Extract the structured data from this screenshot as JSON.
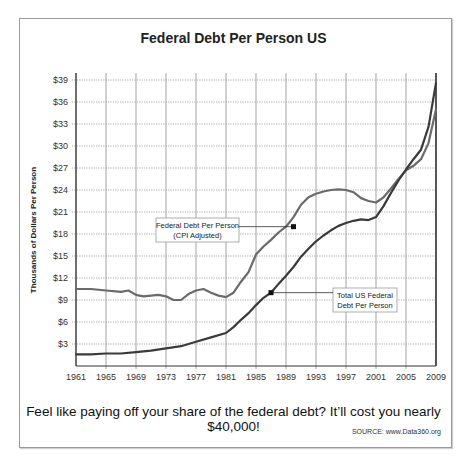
{
  "chart_data": {
    "type": "line",
    "title": "Federal Debt Per Person US",
    "xlabel": "",
    "ylabel": "Thousands of Dollars Per Person",
    "x_ticks": [
      "1961",
      "1965",
      "1969",
      "1973",
      "1977",
      "1981",
      "1985",
      "1989",
      "1993",
      "1997",
      "2001",
      "2005",
      "2009"
    ],
    "y_ticks": [
      "$3",
      "$6",
      "$9",
      "$12",
      "$15",
      "$18",
      "$21",
      "$24",
      "$27",
      "$30",
      "$33",
      "$36",
      "$39"
    ],
    "xlim": [
      1961,
      2009
    ],
    "ylim": [
      0,
      40
    ],
    "grid": true,
    "series": [
      {
        "name": "Federal Debt Per Person (CPI Adjusted)",
        "color": "#6a6a6a",
        "x": [
          1961,
          1963,
          1965,
          1967,
          1968,
          1969,
          1970,
          1972,
          1973,
          1974,
          1975,
          1976,
          1977,
          1978,
          1979,
          1980,
          1981,
          1982,
          1983,
          1984,
          1985,
          1986,
          1987,
          1988,
          1989,
          1990,
          1991,
          1992,
          1993,
          1994,
          1995,
          1996,
          1997,
          1998,
          1999,
          2000,
          2001,
          2002,
          2003,
          2004,
          2005,
          2006,
          2007,
          2008,
          2009
        ],
        "values": [
          10.5,
          10.5,
          10.3,
          10.1,
          10.3,
          9.7,
          9.5,
          9.7,
          9.5,
          9.0,
          9.0,
          9.8,
          10.3,
          10.5,
          10.0,
          9.6,
          9.4,
          10.0,
          11.5,
          12.8,
          15.2,
          16.3,
          17.2,
          18.2,
          19.0,
          20.3,
          22.0,
          23.0,
          23.5,
          23.8,
          24.0,
          24.1,
          24.0,
          23.7,
          22.9,
          22.5,
          22.3,
          23.0,
          24.2,
          25.5,
          26.7,
          27.3,
          28.2,
          30.4,
          35.0
        ]
      },
      {
        "name": "Total US Federal Debt Per Person",
        "color": "#3a3a3a",
        "x": [
          1961,
          1963,
          1965,
          1967,
          1969,
          1971,
          1973,
          1975,
          1977,
          1979,
          1981,
          1982,
          1983,
          1984,
          1985,
          1986,
          1987,
          1988,
          1989,
          1990,
          1991,
          1992,
          1993,
          1994,
          1995,
          1996,
          1997,
          1998,
          1999,
          2000,
          2001,
          2002,
          2003,
          2004,
          2005,
          2006,
          2007,
          2008,
          2009
        ],
        "values": [
          1.6,
          1.6,
          1.7,
          1.7,
          1.9,
          2.1,
          2.4,
          2.7,
          3.3,
          3.9,
          4.5,
          5.3,
          6.3,
          7.2,
          8.3,
          9.3,
          10.0,
          11.2,
          12.3,
          13.5,
          14.9,
          16.0,
          17.0,
          17.8,
          18.5,
          19.1,
          19.5,
          19.8,
          20.0,
          19.9,
          20.3,
          21.8,
          23.6,
          25.3,
          26.8,
          28.2,
          29.5,
          32.6,
          38.6
        ]
      }
    ],
    "annotations": [
      {
        "text_lines": [
          "Federal Debt Per Person",
          "(CPI Adjusted)"
        ],
        "points_to": {
          "x": 1990,
          "y": 19.0
        },
        "series": 0
      },
      {
        "text_lines": [
          "Total US Federal",
          "Debt Per Person"
        ],
        "points_to": {
          "x": 1987,
          "y": 10.0
        },
        "series": 1
      }
    ]
  },
  "caption": "Feel like paying off your share of the federal debt? It’ll cost you nearly $40,000!",
  "source": "SOURCE: www.Data360.org"
}
